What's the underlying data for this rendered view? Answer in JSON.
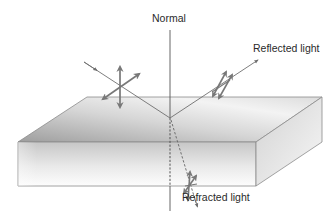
{
  "diagram": {
    "labels": {
      "normal": "Normal",
      "reflected": "Reflected light",
      "refracted": "Refracted light"
    },
    "colors": {
      "ray": "#6f6f6f",
      "polarization_arrow": "#777777",
      "normal_line": "#555555",
      "slab_top_dark": "#a9a9a9",
      "slab_top_light": "#f2f2f2",
      "slab_front_dark": "#c4c4c4",
      "slab_front_light": "#fbfbfb",
      "slab_edge": "#8c8c8c",
      "text": "#2a2a2a"
    },
    "elements": [
      {
        "id": "slab",
        "shape": "rectangular prism",
        "description": "transparent medium block"
      },
      {
        "id": "normal-line",
        "shape": "vertical line",
        "style": "solid above surface, dashed inside slab"
      },
      {
        "id": "incident-ray",
        "shape": "arrow",
        "direction": "down-right into surface"
      },
      {
        "id": "reflected-ray",
        "shape": "arrow",
        "direction": "up-right away from surface"
      },
      {
        "id": "refracted-ray",
        "shape": "dashed arrow",
        "direction": "down-right inside slab"
      },
      {
        "id": "incident-polarization",
        "shape": "two crossed double-headed arrows",
        "meaning": "unpolarized light"
      },
      {
        "id": "reflected-polarization",
        "shape": "double-headed arrows",
        "meaning": "partially polarized"
      },
      {
        "id": "refracted-polarization",
        "shape": "double-headed arrows",
        "meaning": "partially polarized"
      }
    ]
  }
}
